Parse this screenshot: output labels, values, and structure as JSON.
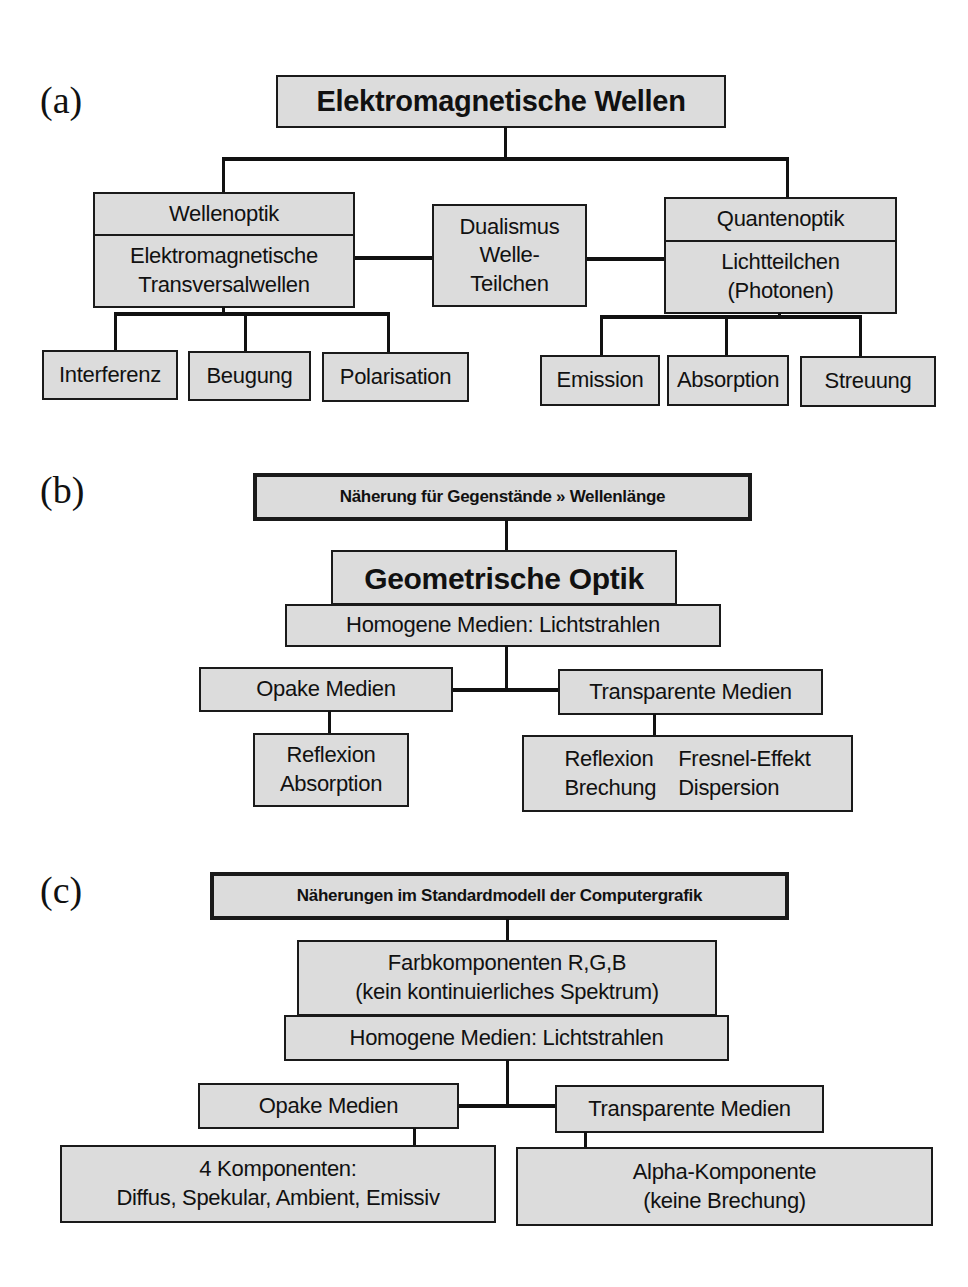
{
  "panel_a": {
    "label": "(a)",
    "root": "Elektromagnetische Wellen",
    "left": {
      "title": "Wellenoptik",
      "body": [
        "Elektromagnetische",
        "Transversalwellen"
      ],
      "children": [
        "Interferenz",
        "Beugung",
        "Polarisation"
      ]
    },
    "center": [
      "Dualismus",
      "Welle-",
      "Teilchen"
    ],
    "right": {
      "title": "Quantenoptik",
      "body": [
        "Lichtteilchen",
        "(Photonen)"
      ],
      "children": [
        "Emission",
        "Absorption",
        "Streuung"
      ]
    }
  },
  "panel_b": {
    "label": "(b)",
    "approximation": "Näherung für Gegenstände » Wellenlänge",
    "title": "Geometrische Optik",
    "media": "Homogene Medien: Lichtstrahlen",
    "opaque": {
      "title": "Opake Medien",
      "effects": [
        "Reflexion",
        "Absorption"
      ]
    },
    "transparent": {
      "title": "Transparente Medien",
      "effects_col1": [
        "Reflexion",
        "Brechung"
      ],
      "effects_col2": [
        "Fresnel-Effekt",
        "Dispersion"
      ]
    }
  },
  "panel_c": {
    "label": "(c)",
    "approximation": "Näherungen im Standardmodell der Computergrafik",
    "color": [
      "Farbkomponenten R,G,B",
      "(kein kontinuierliches Spektrum)"
    ],
    "media": "Homogene Medien: Lichtstrahlen",
    "opaque": {
      "title": "Opake Medien",
      "effects": [
        "4 Komponenten:",
        "Diffus, Spekular, Ambient, Emissiv"
      ]
    },
    "transparent": {
      "title": "Transparente Medien",
      "effects": [
        "Alpha-Komponente",
        "(keine Brechung)"
      ]
    }
  },
  "colors": {
    "box_fill": "#dcdcdc",
    "line": "#111111",
    "background": "#ffffff"
  }
}
